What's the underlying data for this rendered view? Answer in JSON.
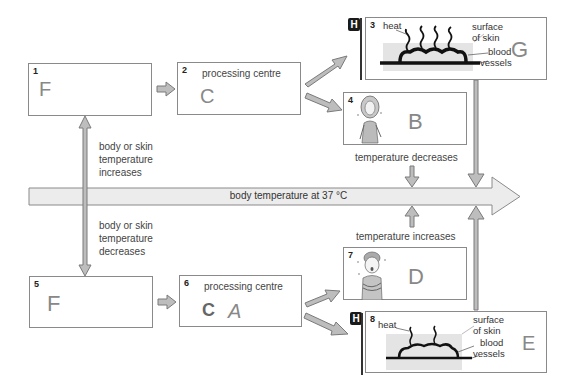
{
  "main_axis": {
    "label": "body temperature at 37 °C"
  },
  "left_arrows": {
    "up_label": [
      "body or skin",
      "temperature",
      "increases"
    ],
    "down_label": [
      "body or skin",
      "temperature",
      "decreases"
    ]
  },
  "mid_labels": {
    "decrease": "temperature decreases",
    "increase": "temperature increases"
  },
  "boxes": [
    {
      "number": "1",
      "title": "",
      "answer": "F"
    },
    {
      "number": "2",
      "title": "processing centre",
      "answer": "C"
    },
    {
      "number": "3",
      "title": "",
      "answer": "G",
      "badge": "H",
      "diagram": {
        "heat": "heat",
        "surface": [
          "surface",
          "of skin"
        ],
        "vessels": [
          "blood",
          "vessels"
        ]
      }
    },
    {
      "number": "4",
      "title": "",
      "answer": "B",
      "illustration": "person-sweating"
    },
    {
      "number": "5",
      "title": "",
      "answer": "F"
    },
    {
      "number": "6",
      "title": "processing centre",
      "answer": "A",
      "smudge": "C"
    },
    {
      "number": "7",
      "title": "",
      "answer": "D",
      "illustration": "person-shivering"
    },
    {
      "number": "8",
      "title": "",
      "answer": "E",
      "badge": "H",
      "diagram": {
        "heat": "heat",
        "surface": [
          "surface",
          "of skin"
        ],
        "vessels": [
          "blood",
          "vessels"
        ]
      }
    }
  ],
  "colors": {
    "arrow_fill": "#bdbdbd",
    "arrow_stroke": "#7a7a7a",
    "main_arrow_fill": "#ececec",
    "box_border": "#8a8a8a",
    "badge": "#1a1a1a",
    "handwriting": "#888888"
  }
}
